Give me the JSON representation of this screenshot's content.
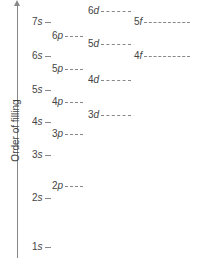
{
  "diagram": {
    "title": "",
    "axis_label": "Order of filling",
    "orbitals": [
      {
        "id": "1s",
        "n": "1",
        "l": "s",
        "x": 32,
        "y": 247,
        "dash": 6
      },
      {
        "id": "2s",
        "n": "2",
        "l": "s",
        "x": 32,
        "y": 198,
        "dash": 6
      },
      {
        "id": "2p",
        "n": "2",
        "l": "p",
        "x": 52,
        "y": 186,
        "dash": 18
      },
      {
        "id": "3s",
        "n": "3",
        "l": "s",
        "x": 32,
        "y": 155,
        "dash": 6
      },
      {
        "id": "3p",
        "n": "3",
        "l": "p",
        "x": 52,
        "y": 134,
        "dash": 18
      },
      {
        "id": "4s",
        "n": "4",
        "l": "s",
        "x": 32,
        "y": 122,
        "dash": 6
      },
      {
        "id": "3d",
        "n": "3",
        "l": "d",
        "x": 88,
        "y": 115,
        "dash": 30
      },
      {
        "id": "4p",
        "n": "4",
        "l": "p",
        "x": 52,
        "y": 102,
        "dash": 18
      },
      {
        "id": "5s",
        "n": "5",
        "l": "s",
        "x": 32,
        "y": 90,
        "dash": 6
      },
      {
        "id": "4d",
        "n": "4",
        "l": "d",
        "x": 88,
        "y": 80,
        "dash": 30
      },
      {
        "id": "5p",
        "n": "5",
        "l": "p",
        "x": 52,
        "y": 69,
        "dash": 18
      },
      {
        "id": "6s",
        "n": "6",
        "l": "s",
        "x": 32,
        "y": 56,
        "dash": 6
      },
      {
        "id": "4f",
        "n": "4",
        "l": "f",
        "x": 134,
        "y": 56,
        "dash": 46
      },
      {
        "id": "5d",
        "n": "5",
        "l": "d",
        "x": 88,
        "y": 44,
        "dash": 30
      },
      {
        "id": "6p",
        "n": "6",
        "l": "p",
        "x": 52,
        "y": 36,
        "dash": 18
      },
      {
        "id": "7s",
        "n": "7",
        "l": "s",
        "x": 32,
        "y": 22,
        "dash": 6
      },
      {
        "id": "5f",
        "n": "5",
        "l": "f",
        "x": 134,
        "y": 22,
        "dash": 46
      },
      {
        "id": "6d",
        "n": "6",
        "l": "d",
        "x": 88,
        "y": 11,
        "dash": 30
      }
    ]
  }
}
